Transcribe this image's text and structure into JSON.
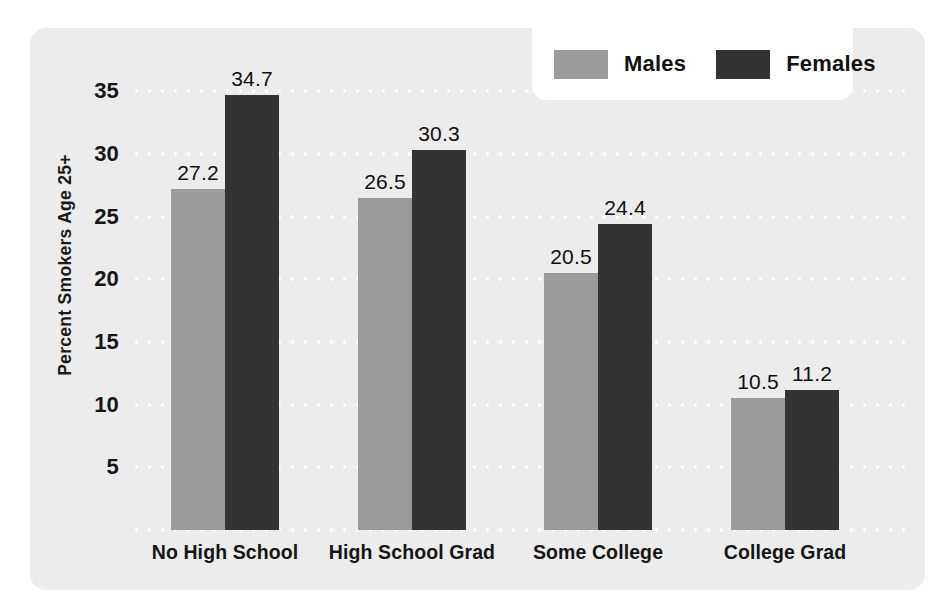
{
  "chart_data": {
    "type": "bar",
    "title": "",
    "xlabel": "",
    "ylabel": "Percent Smokers Age 25+",
    "categories": [
      "No High School",
      "High School Grad",
      "Some College",
      "College Grad"
    ],
    "series": [
      {
        "name": "Males",
        "color": "#9b9b9b",
        "values": [
          27.2,
          26.5,
          20.5,
          10.5
        ]
      },
      {
        "name": "Females",
        "color": "#333335",
        "values": [
          34.7,
          30.3,
          24.4,
          11.2
        ]
      }
    ],
    "ylim": [
      0,
      37.5
    ],
    "yticks": [
      5,
      10,
      15,
      20,
      25,
      30,
      35
    ],
    "ytick_labels": [
      "5",
      "10",
      "15",
      "20",
      "25",
      "30",
      "35"
    ],
    "grid": true,
    "grid_style": "dotted-white",
    "legend_position": "top-right",
    "value_labels": [
      "27.2",
      "34.7",
      "26.5",
      "30.3",
      "20.5",
      "24.4",
      "10.5",
      "11.2"
    ],
    "background_color": "#ececec",
    "figure_color": "#ffffff"
  },
  "legend": {
    "entries": [
      {
        "label": "Males",
        "swatch": "males-swatch"
      },
      {
        "label": "Females",
        "swatch": "females-swatch"
      }
    ]
  }
}
